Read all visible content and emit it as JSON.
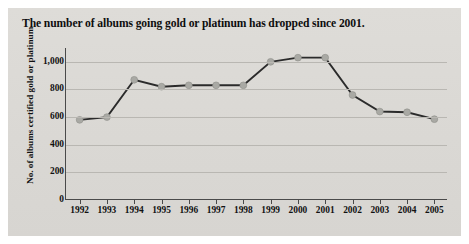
{
  "figure": {
    "title": "The number of albums going gold or platinum has dropped since 2001.",
    "panel_color": "#d9d9d6",
    "line_color": "#2b2b2b",
    "marker_color": "#a9a9a4",
    "grid_color": "#b9b7b2",
    "axis_color": "#4a4a4a"
  },
  "chart_data": {
    "type": "line",
    "title": "The number of albums going gold or platinum has dropped since 2001.",
    "xlabel": "",
    "ylabel": "No. of albums certified gold or platinum",
    "categories": [
      "1992",
      "1993",
      "1994",
      "1995",
      "1996",
      "1997",
      "1998",
      "1999",
      "2000",
      "2001",
      "2002",
      "2003",
      "2004",
      "2005"
    ],
    "values": [
      580,
      600,
      870,
      820,
      830,
      830,
      830,
      1000,
      1030,
      1030,
      760,
      640,
      635,
      585
    ],
    "ylim": [
      0,
      1100
    ],
    "yticks": [
      0,
      200,
      400,
      600,
      800,
      1000
    ],
    "ytick_labels": [
      "0",
      "200",
      "400",
      "600",
      "800",
      "1,000"
    ],
    "grid": true,
    "legend": false,
    "marker": "circle"
  }
}
